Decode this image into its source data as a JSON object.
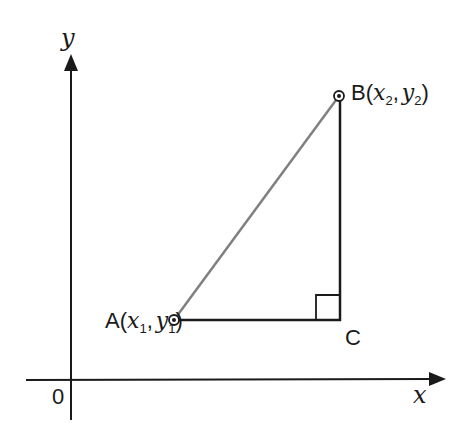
{
  "diagram": {
    "type": "coordinate-geometry",
    "axes": {
      "x_label": "x",
      "y_label": "y",
      "origin_label": "0"
    },
    "points": {
      "A": {
        "name": "A",
        "coords": "(x1, y1)",
        "x_sub": "1",
        "y_sub": "1"
      },
      "B": {
        "name": "B",
        "coords": "(x2, y2)",
        "x_sub": "2",
        "y_sub": "2"
      },
      "C": {
        "name": "C"
      }
    },
    "segments": [
      {
        "from": "A",
        "to": "B",
        "color": "#808080",
        "label": "hypotenuse"
      },
      {
        "from": "A",
        "to": "C",
        "color": "#1a1a1a",
        "label": "horizontal leg"
      },
      {
        "from": "C",
        "to": "B",
        "color": "#1a1a1a",
        "label": "vertical leg"
      }
    ],
    "right_angle_at": "C",
    "colors": {
      "axis": "#1a1a1a",
      "hypotenuse": "#808080",
      "legs": "#1a1a1a",
      "background": "#ffffff"
    }
  },
  "labels": {
    "x_axis": "x",
    "y_axis": "y",
    "origin": "0",
    "A_name": "A",
    "B_name": "B",
    "C_name": "C",
    "x_var": "x",
    "y_var": "y",
    "sub1": "1",
    "sub2": "2",
    "open_paren": "(",
    "close_paren": ")",
    "comma": ","
  }
}
